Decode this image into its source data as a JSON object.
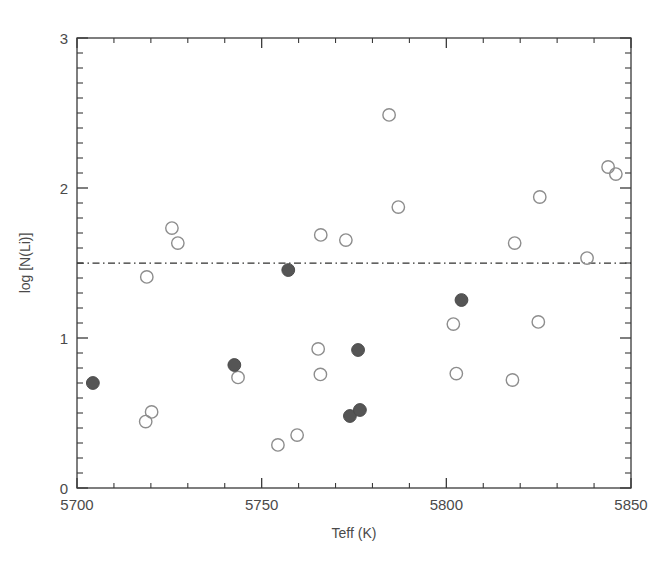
{
  "figure": {
    "background_color": "#ffffff",
    "axis_color": "#3a3a3a",
    "open_marker_color": "#8d8d8d",
    "filled_marker_color": "#555555",
    "reference_line_color": "#30302f"
  },
  "axes": {
    "x_title": "Teff (K)",
    "y_title": "log [N(Li)]",
    "x_ticks": [
      "5700",
      "5750",
      "5800",
      "5850"
    ],
    "y_ticks": [
      "0",
      "1",
      "2",
      "3"
    ]
  },
  "chart_data": {
    "type": "scatter",
    "title": "",
    "xlabel": "Teff (K)",
    "ylabel": "log [N(Li)]",
    "xlim": [
      5700,
      5850
    ],
    "ylim": [
      0,
      3
    ],
    "x_ticks": [
      5700,
      5750,
      5800,
      5850
    ],
    "y_ticks": [
      0,
      1,
      2,
      3
    ],
    "x_minor_tick_step": 10,
    "y_minor_tick_step": 0.1,
    "grid": false,
    "legend": "none",
    "annotations": [
      {
        "kind": "horizontal-reference-line",
        "style": "dash-dot",
        "y": 1.5,
        "label": ""
      }
    ],
    "series": [
      {
        "name": "open-circles",
        "marker": "open-circle",
        "color": "#8d8d8d",
        "points": [
          {
            "x": 5718.6,
            "y": 0.443
          },
          {
            "x": 5720.2,
            "y": 0.507
          },
          {
            "x": 5718.9,
            "y": 1.407
          },
          {
            "x": 5725.7,
            "y": 1.733
          },
          {
            "x": 5727.3,
            "y": 1.633
          },
          {
            "x": 5743.6,
            "y": 0.737
          },
          {
            "x": 5754.4,
            "y": 0.287
          },
          {
            "x": 5759.6,
            "y": 0.353
          },
          {
            "x": 5765.3,
            "y": 0.927
          },
          {
            "x": 5766.0,
            "y": 1.687
          },
          {
            "x": 5772.8,
            "y": 1.653
          },
          {
            "x": 5765.9,
            "y": 0.757
          },
          {
            "x": 5784.5,
            "y": 2.487
          },
          {
            "x": 5787.0,
            "y": 1.873
          },
          {
            "x": 5801.9,
            "y": 1.093
          },
          {
            "x": 5802.7,
            "y": 0.763
          },
          {
            "x": 5817.9,
            "y": 0.72
          },
          {
            "x": 5818.5,
            "y": 1.633
          },
          {
            "x": 5824.9,
            "y": 1.107
          },
          {
            "x": 5825.3,
            "y": 1.94
          },
          {
            "x": 5838.1,
            "y": 1.533
          },
          {
            "x": 5843.8,
            "y": 2.14
          },
          {
            "x": 5845.9,
            "y": 2.093
          }
        ]
      },
      {
        "name": "filled-circles",
        "marker": "filled-circle",
        "color": "#555555",
        "points": [
          {
            "x": 5704.3,
            "y": 0.7
          },
          {
            "x": 5742.6,
            "y": 0.82
          },
          {
            "x": 5757.2,
            "y": 1.453
          },
          {
            "x": 5773.9,
            "y": 0.48
          },
          {
            "x": 5776.6,
            "y": 0.52
          },
          {
            "x": 5776.1,
            "y": 0.92
          },
          {
            "x": 5804.1,
            "y": 1.253
          }
        ]
      }
    ]
  }
}
